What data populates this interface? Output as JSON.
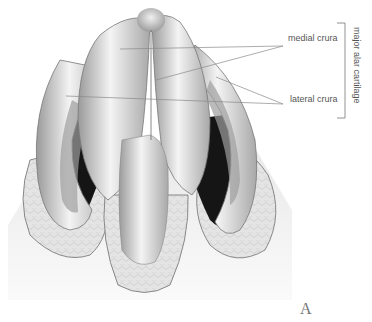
{
  "figure": {
    "panel_letter": "A",
    "labels": {
      "medial": "medial crura",
      "lateral": "lateral crura",
      "group": "major alar cartilage"
    },
    "colors": {
      "line": "#8a8a8a",
      "text": "#555555",
      "cartilage_light": "#f2f2f2",
      "cartilage_mid": "#b5b5b5",
      "cavity_dark": "#1a1a1a",
      "fibrofatty": "#d8d8d8"
    }
  }
}
